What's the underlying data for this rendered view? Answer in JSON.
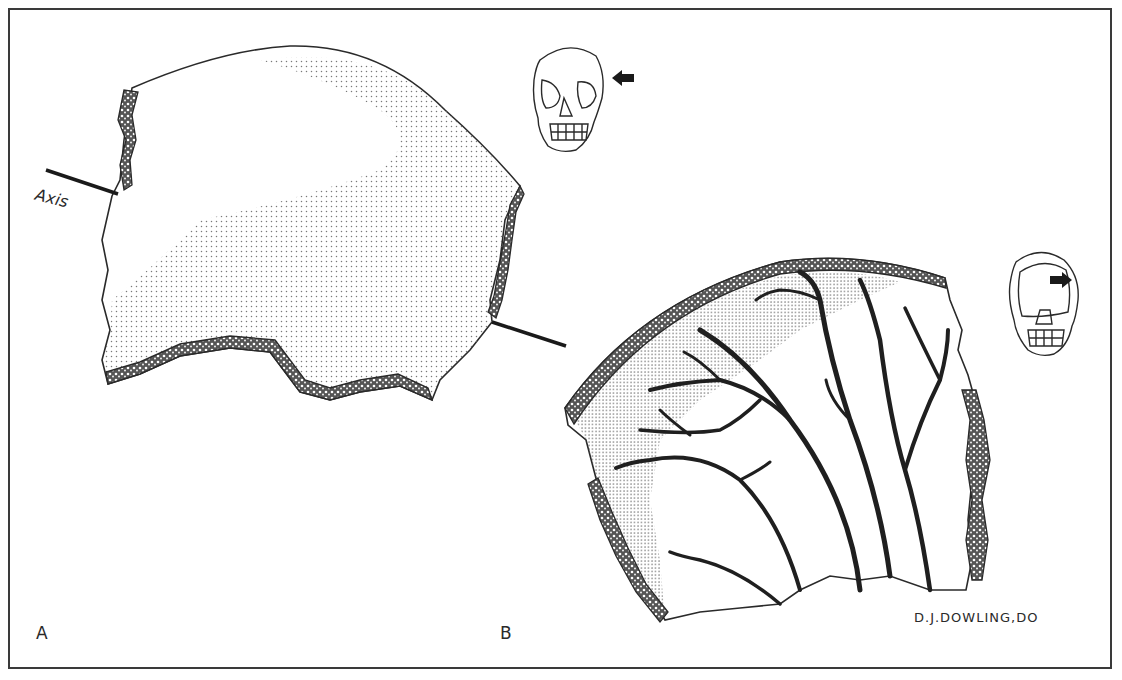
{
  "figure": {
    "type": "anatomical illustration",
    "panels": [
      {
        "id": "A",
        "label": "A",
        "subject": "cranial bone fragment, external view",
        "annotations": {
          "axis_label": "Axis"
        },
        "inset": {
          "icon": "skull-frontal-view-icon",
          "arrow": "arrow-left-icon"
        }
      },
      {
        "id": "B",
        "label": "B",
        "subject": "cranial bone fragment, internal view with branching vascular grooves",
        "inset": {
          "icon": "skull-frontal-view-icon",
          "arrow": "arrow-right-icon"
        }
      }
    ],
    "signature": "D.J.DOWLING,DO"
  },
  "colors": {
    "ink": "#2a2a2a",
    "frame": "#3a3a3a",
    "stipple": "#6a6a6a",
    "background": "#ffffff"
  }
}
